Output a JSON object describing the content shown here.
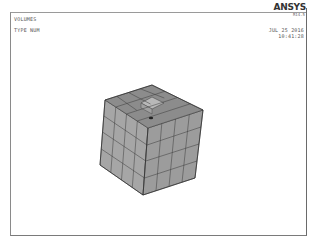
{
  "window": {
    "left_labels": [
      "VOLUMES",
      "TYPE NUM"
    ],
    "brand": "ANSYS",
    "release": "R14.5",
    "date": "JUL 25 2016",
    "time": "10:41:28"
  },
  "model": {
    "description": "Meshed cube volume with recessed cell on top face",
    "colors": {
      "top_face": "#8e8e8e",
      "left_face": "#a6a6a6",
      "right_face": "#9a9a9a",
      "edge": "#3a3a3a",
      "hole": "#b4b4b4"
    },
    "grid_divisions": 4
  }
}
